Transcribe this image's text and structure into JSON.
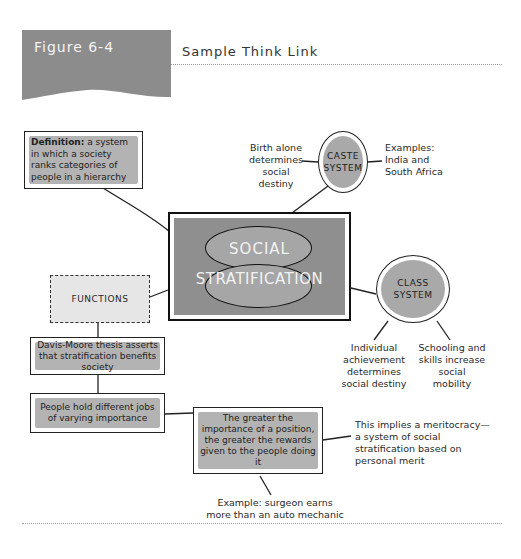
{
  "header": {
    "figure_label": "Figure 6-4",
    "title": "Sample Think Link"
  },
  "nodes": {
    "definition": {
      "bold": "Definition:",
      "text": " a system in which a society ranks categories of people in a hierarchy"
    },
    "central": {
      "line1": "SOCIAL",
      "line2": "STRATIFICATION"
    },
    "caste": {
      "label": "CASTE SYSTEM",
      "left_note": "Birth alone determines social destiny",
      "right_note": "Examples: India and South Africa"
    },
    "class": {
      "label": "CLASS SYSTEM",
      "left_note": "Individual achievement determines social destiny",
      "right_note": "Schooling and skills increase social mobility"
    },
    "functions": {
      "label": "FUNCTIONS"
    },
    "davis_moore": {
      "text": "Davis-Moore thesis asserts that stratification benefits society"
    },
    "jobs": {
      "text": "People hold different jobs of varying importance"
    },
    "rewards": {
      "text": "The greater the importance of a position, the greater the rewards given to the people doing it"
    },
    "meritocracy": {
      "text": "This implies a meritocracy—a system of social stratification based on personal merit"
    },
    "example": {
      "text": "Example: surgeon earns more than an auto mechanic"
    }
  },
  "colors": {
    "banner": "#8c8c8c",
    "box_fill": "#b3b3b3",
    "central_fill": "#8f8f8f",
    "circle_fill": "#a9a9a9",
    "functions_fill": "#e6e6e6",
    "line": "#222222"
  }
}
